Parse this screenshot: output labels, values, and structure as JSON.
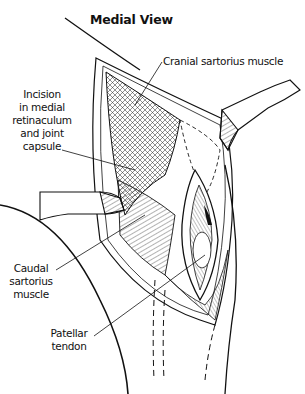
{
  "figure": {
    "title": "Medial View",
    "labels": {
      "cranial_sartorius": "Cranial sartorius muscle",
      "incision_line1": "Incision",
      "incision_line2": "in medial",
      "incision_line3": "retinaculum",
      "incision_line4": "and joint",
      "incision_line5": "capsule",
      "caudal_line1": "Caudal",
      "caudal_line2": "sartorius",
      "caudal_line3": "muscle",
      "patellar_line1": "Patellar",
      "patellar_line2": "tendon"
    },
    "colors": {
      "ink": "#111111",
      "background": "#ffffff",
      "shade": "#9a9a9a"
    },
    "icons": [
      "retractor-upper-right",
      "retractor-left",
      "surgical-incision"
    ]
  }
}
